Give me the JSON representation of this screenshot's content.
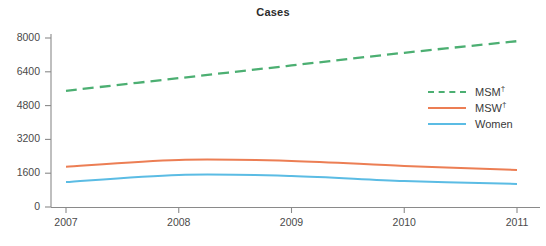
{
  "chart_data": {
    "type": "line",
    "title": "Cases",
    "xlabel": "",
    "ylabel": "",
    "x": [
      2007,
      2008,
      2009,
      2010,
      2011
    ],
    "xtick_labels": [
      "2007",
      "2008",
      "2009",
      "2010",
      "2011"
    ],
    "ytick_labels": [
      "0",
      "1600",
      "3200",
      "4800",
      "6400",
      "8000"
    ],
    "ytick_values": [
      0,
      1600,
      3200,
      4800,
      6400,
      8000
    ],
    "xlim": [
      2007,
      2011
    ],
    "ylim": [
      0,
      8000
    ],
    "grid": false,
    "legend_position": "center-right",
    "series": [
      {
        "name": "MSM†",
        "label_text": "MSM",
        "label_sup": "†",
        "color": "#4CAF72",
        "style": "dashed",
        "values": [
          5500,
          6100,
          6700,
          7300,
          7850
        ]
      },
      {
        "name": "MSW†",
        "label_text": "MSW",
        "label_sup": "†",
        "color": "#EC7E54",
        "style": "solid",
        "values": [
          1900,
          2230,
          2180,
          1940,
          1750
        ]
      },
      {
        "name": "Women",
        "label_text": "Women",
        "label_sup": "",
        "color": "#5BBCE4",
        "style": "solid",
        "values": [
          1180,
          1520,
          1470,
          1230,
          1090
        ]
      }
    ]
  },
  "axes": {
    "axis_color": "#8a8a8a"
  }
}
